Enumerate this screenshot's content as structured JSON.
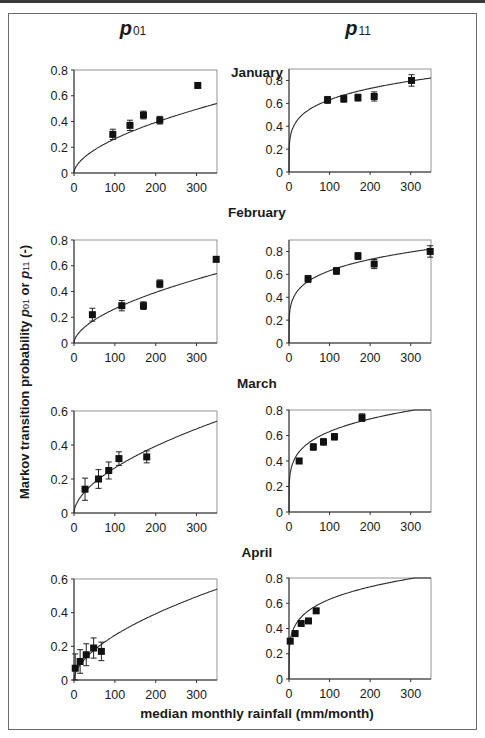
{
  "chart_data": {
    "type": "scatter",
    "column_titles": [
      "p01",
      "p11"
    ],
    "ylabel": "Markov transition probability p01 or p11 (-)",
    "xlabel": "median monthly rainfall (mm/month)",
    "x_ticks": [
      0,
      100,
      200,
      300
    ],
    "xlim": [
      0,
      350
    ],
    "panels": [
      {
        "month": "January",
        "p01": {
          "ylim": [
            0,
            0.8
          ],
          "y_ticks": [
            0,
            0.2,
            0.4,
            0.6,
            0.8
          ],
          "points": [
            {
              "x": 95,
              "y": 0.3,
              "err": 0.04
            },
            {
              "x": 137,
              "y": 0.37,
              "err": 0.04
            },
            {
              "x": 170,
              "y": 0.45,
              "err": 0.03
            },
            {
              "x": 210,
              "y": 0.41,
              "err": 0.03
            },
            {
              "x": 303,
              "y": 0.68,
              "err": 0.02
            }
          ],
          "curve": {
            "a": 0.0195,
            "b": 0.567
          }
        },
        "p11": {
          "ylim": [
            0,
            0.9
          ],
          "y_ticks": [
            0,
            0.2,
            0.4,
            0.6,
            0.8
          ],
          "points": [
            {
              "x": 95,
              "y": 0.63,
              "err": 0.03
            },
            {
              "x": 135,
              "y": 0.64,
              "err": 0.03
            },
            {
              "x": 170,
              "y": 0.65,
              "err": 0.03
            },
            {
              "x": 210,
              "y": 0.66,
              "err": 0.04
            },
            {
              "x": 302,
              "y": 0.8,
              "err": 0.05
            }
          ],
          "curve": {
            "a": 0.24,
            "b": 0.21
          }
        }
      },
      {
        "month": "February",
        "p01": {
          "ylim": [
            0,
            0.8
          ],
          "y_ticks": [
            0,
            0.2,
            0.4,
            0.6,
            0.8
          ],
          "points": [
            {
              "x": 45,
              "y": 0.22,
              "err": 0.05
            },
            {
              "x": 117,
              "y": 0.29,
              "err": 0.04
            },
            {
              "x": 170,
              "y": 0.29,
              "err": 0.03
            },
            {
              "x": 210,
              "y": 0.46,
              "err": 0.03
            },
            {
              "x": 348,
              "y": 0.65,
              "err": 0.02
            }
          ],
          "curve": {
            "a": 0.0195,
            "b": 0.567
          }
        },
        "p11": {
          "ylim": [
            0,
            0.9
          ],
          "y_ticks": [
            0,
            0.2,
            0.4,
            0.6,
            0.8
          ],
          "points": [
            {
              "x": 47,
              "y": 0.56,
              "err": 0.03
            },
            {
              "x": 117,
              "y": 0.63,
              "err": 0.03
            },
            {
              "x": 170,
              "y": 0.76,
              "err": 0.03
            },
            {
              "x": 210,
              "y": 0.69,
              "err": 0.04
            },
            {
              "x": 348,
              "y": 0.8,
              "err": 0.05
            }
          ],
          "curve": {
            "a": 0.24,
            "b": 0.21
          }
        }
      },
      {
        "month": "March",
        "p01": {
          "ylim": [
            0,
            0.6
          ],
          "y_ticks": [
            0,
            0.2,
            0.4,
            0.6
          ],
          "points": [
            {
              "x": 27,
              "y": 0.14,
              "err": 0.065
            },
            {
              "x": 60,
              "y": 0.2,
              "err": 0.055
            },
            {
              "x": 85,
              "y": 0.25,
              "err": 0.05
            },
            {
              "x": 110,
              "y": 0.32,
              "err": 0.04
            },
            {
              "x": 178,
              "y": 0.33,
              "err": 0.035
            }
          ],
          "curve": {
            "a": 0.0195,
            "b": 0.567
          }
        },
        "p11": {
          "ylim": [
            0,
            0.8
          ],
          "y_ticks": [
            0,
            0.2,
            0.4,
            0.6,
            0.8
          ],
          "points": [
            {
              "x": 25,
              "y": 0.4,
              "err": 0.02
            },
            {
              "x": 60,
              "y": 0.51,
              "err": 0.025
            },
            {
              "x": 85,
              "y": 0.55,
              "err": 0.025
            },
            {
              "x": 112,
              "y": 0.59,
              "err": 0.025
            },
            {
              "x": 180,
              "y": 0.74,
              "err": 0.03
            }
          ],
          "curve": {
            "a": 0.24,
            "b": 0.21
          }
        }
      },
      {
        "month": "April",
        "p01": {
          "ylim": [
            0,
            0.6
          ],
          "y_ticks": [
            0,
            0.2,
            0.4,
            0.6
          ],
          "points": [
            {
              "x": 3,
              "y": 0.07,
              "err": 0.085
            },
            {
              "x": 15,
              "y": 0.11,
              "err": 0.07
            },
            {
              "x": 30,
              "y": 0.15,
              "err": 0.065
            },
            {
              "x": 48,
              "y": 0.19,
              "err": 0.06
            },
            {
              "x": 67,
              "y": 0.17,
              "err": 0.055
            }
          ],
          "curve": {
            "a": 0.0195,
            "b": 0.567
          }
        },
        "p11": {
          "ylim": [
            0,
            0.8
          ],
          "y_ticks": [
            0,
            0.2,
            0.4,
            0.6,
            0.8
          ],
          "points": [
            {
              "x": 3,
              "y": 0.3,
              "err": 0.015
            },
            {
              "x": 15,
              "y": 0.36,
              "err": 0.015
            },
            {
              "x": 30,
              "y": 0.44,
              "err": 0.015
            },
            {
              "x": 48,
              "y": 0.46,
              "err": 0.015
            },
            {
              "x": 67,
              "y": 0.54,
              "err": 0.015
            }
          ],
          "curve": {
            "a": 0.24,
            "b": 0.21
          }
        }
      }
    ],
    "grid": false,
    "legend": null
  },
  "layout": {
    "panels_px": [
      {
        "left": {
          "x0": 74,
          "x1": 217,
          "y0": 173,
          "ytop": 70
        },
        "right": {
          "x0": 289,
          "x1": 431,
          "y0": 172,
          "ytop": 69
        },
        "title_y": 77
      },
      {
        "left": {
          "x0": 74,
          "x1": 217,
          "y0": 343,
          "ytop": 240
        },
        "right": {
          "x0": 289,
          "x1": 431,
          "y0": 343,
          "ytop": 240
        },
        "title_y": 217
      },
      {
        "left": {
          "x0": 74,
          "x1": 217,
          "y0": 513,
          "ytop": 411
        },
        "right": {
          "x0": 289,
          "x1": 431,
          "y0": 512,
          "ytop": 410
        },
        "title_y": 388
      },
      {
        "left": {
          "x0": 74,
          "x1": 217,
          "y0": 680,
          "ytop": 579
        },
        "right": {
          "x0": 289,
          "x1": 431,
          "y0": 679,
          "ytop": 578
        },
        "title_y": 557
      }
    ]
  },
  "labels": {
    "col_left_main": "p",
    "col_left_sub": "01",
    "col_right_main": "p",
    "col_right_sub": "11",
    "ylabel_pre": "Markov transition probability ",
    "ylabel_p1": "p",
    "ylabel_s1": "01",
    "ylabel_mid": " or ",
    "ylabel_p2": "p",
    "ylabel_s2": "11",
    "ylabel_post": " (-)",
    "xlabel": "median monthly rainfall (mm/month)"
  }
}
